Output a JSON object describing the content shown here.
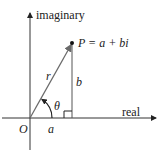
{
  "diagram": {
    "axes": {
      "x_label": "real",
      "y_label": "imaginary"
    },
    "origin_label": "O",
    "point_label": "P = a + bi",
    "segment_labels": {
      "radius": "r",
      "vertical": "b",
      "horizontal": "a",
      "angle": "θ"
    },
    "colors": {
      "stroke": "#333333",
      "vector": "#6a6a6a",
      "text": "#222222"
    }
  }
}
